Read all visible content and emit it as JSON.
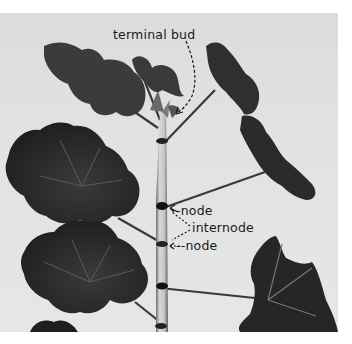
{
  "figure": {
    "labels": {
      "terminal_bud": "terminal bud",
      "node_upper": "-node",
      "internode": "internode",
      "node_lower": "--node"
    },
    "colors": {
      "background": "#e2e2e2",
      "leaf": "#2a2a2a",
      "stem": "#bdbdbd",
      "text": "#1a1a1a"
    }
  }
}
